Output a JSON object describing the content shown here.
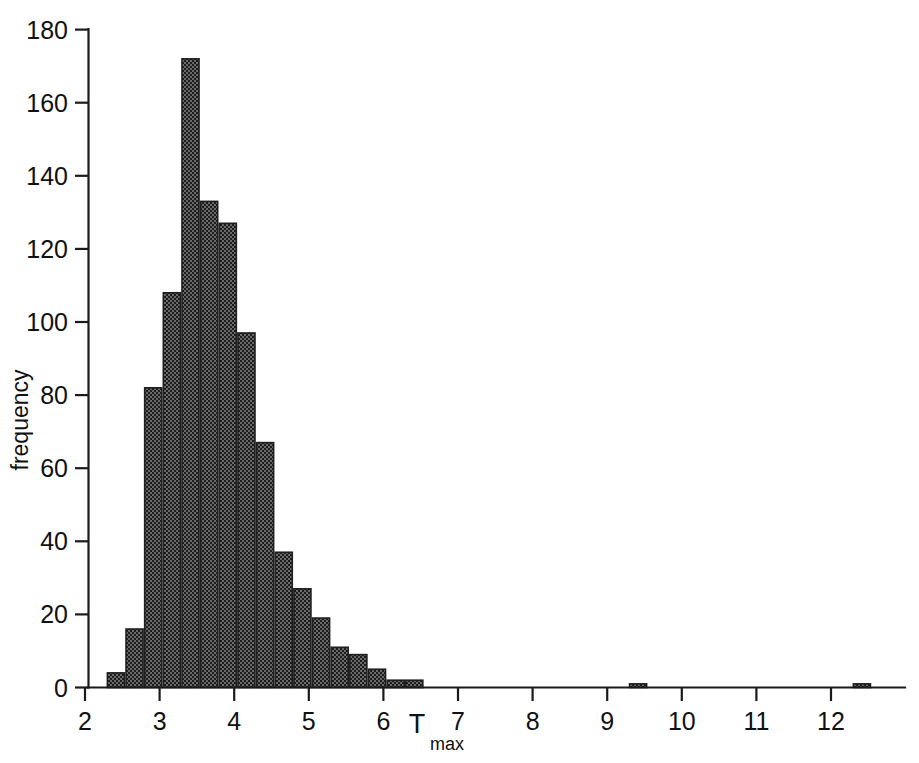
{
  "figure": {
    "background_color": "#ffffff",
    "ink_color": "#1a1a1a",
    "bar_fill_color": "#4f4f4f",
    "bar_edge_color": "#1f1f1f"
  },
  "chart_data": {
    "type": "bar",
    "title": "",
    "subtitle": "",
    "xlabel": "T",
    "xlabel_subscript": "max",
    "ylabel": "frequency",
    "xlim": [
      2.0,
      12.75
    ],
    "ylim": [
      0,
      180
    ],
    "grid": false,
    "legend": null,
    "bin_width": 0.25,
    "x_ticks": [
      2,
      3,
      4,
      5,
      6,
      7,
      8,
      9,
      10,
      11,
      12
    ],
    "x_tick_labels": [
      "2",
      "3",
      "4",
      "5",
      "6",
      "7",
      "8",
      "9",
      "10",
      "11",
      "12"
    ],
    "y_ticks": [
      0,
      20,
      40,
      60,
      80,
      100,
      120,
      140,
      160,
      180
    ],
    "y_tick_labels": [
      "0",
      "20",
      "40",
      "60",
      "80",
      "100",
      "120",
      "140",
      "160",
      "180"
    ],
    "bin_left_edges": [
      2.3,
      2.55,
      2.8,
      3.05,
      3.3,
      3.55,
      3.8,
      4.05,
      4.3,
      4.55,
      4.8,
      5.05,
      5.3,
      5.55,
      5.8,
      6.05,
      6.3,
      9.3,
      12.3
    ],
    "categories": [
      "2.30",
      "2.55",
      "2.80",
      "3.05",
      "3.30",
      "3.55",
      "3.80",
      "4.05",
      "4.30",
      "4.55",
      "4.80",
      "5.05",
      "5.30",
      "5.55",
      "5.80",
      "6.05",
      "6.30",
      "9.30",
      "12.30"
    ],
    "values": [
      4,
      16,
      82,
      108,
      172,
      133,
      127,
      97,
      67,
      37,
      27,
      19,
      11,
      9,
      5,
      2,
      2,
      1,
      1
    ]
  },
  "annotations": {
    "peak_note": "",
    "caption": ""
  }
}
